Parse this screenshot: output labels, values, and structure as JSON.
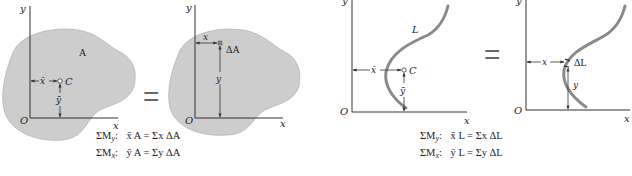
{
  "colors": {
    "region_fill": "#cdcdcd",
    "region_stroke": "#a8a8a8",
    "curve": "#8a8a8a",
    "axis": "#333333",
    "text": "#222222"
  },
  "panels": {
    "area_centroid": {
      "axis_x_label": "x",
      "axis_y_label": "y",
      "origin_label": "O",
      "region_label": "A",
      "centroid_label": "C",
      "xbar_label": "x̄",
      "ybar_label": "ȳ"
    },
    "area_element": {
      "axis_x_label": "x",
      "axis_y_label": "y",
      "origin_label": "O",
      "element_label": "ΔA",
      "x_label": "x",
      "y_label": "y"
    },
    "line_centroid": {
      "axis_x_label": "x",
      "axis_y_label": "y",
      "origin_label": "O",
      "curve_label": "L",
      "centroid_label": "C",
      "xbar_label": "x̄",
      "ybar_label": "ȳ"
    },
    "line_element": {
      "axis_x_label": "x",
      "axis_y_label": "y",
      "origin_label": "O",
      "element_label": "ΔL",
      "x_label": "x",
      "y_label": "y"
    }
  },
  "equals_sign": "=",
  "equations": {
    "area": [
      {
        "lhs": "ΣM",
        "sub": "y",
        "colon": ":",
        "body": "x̄ A = Σx ΔA"
      },
      {
        "lhs": "ΣM",
        "sub": "x",
        "colon": ":",
        "body": "ȳ A = Σy ΔA"
      }
    ],
    "line": [
      {
        "lhs": "ΣM",
        "sub": "y",
        "colon": ":",
        "body": "x̄ L = Σx ΔL"
      },
      {
        "lhs": "ΣM",
        "sub": "x",
        "colon": ":",
        "body": "ȳ L = Σy ΔL"
      }
    ]
  }
}
